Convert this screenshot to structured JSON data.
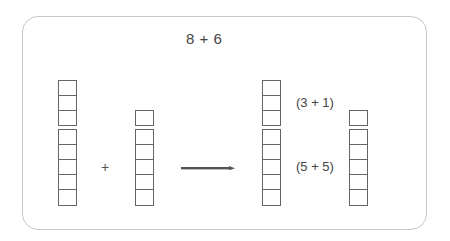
{
  "diagram": {
    "title": "8 + 6",
    "operator": "+",
    "arrow_color": "#555555",
    "box_border_color": "#666666",
    "frame_border_color": "#c8c8c8",
    "before": {
      "left_stack": {
        "total": 8,
        "groups": [
          3,
          5
        ]
      },
      "right_stack": {
        "total": 6,
        "groups": [
          1,
          5
        ]
      }
    },
    "after": {
      "left_stack": {
        "total": 8,
        "groups": [
          3,
          5
        ]
      },
      "right_stack": {
        "total": 6,
        "groups": [
          1,
          5
        ]
      },
      "labels": [
        {
          "text": "(3 + 1)"
        },
        {
          "text": "(5 + 5)"
        }
      ]
    }
  }
}
